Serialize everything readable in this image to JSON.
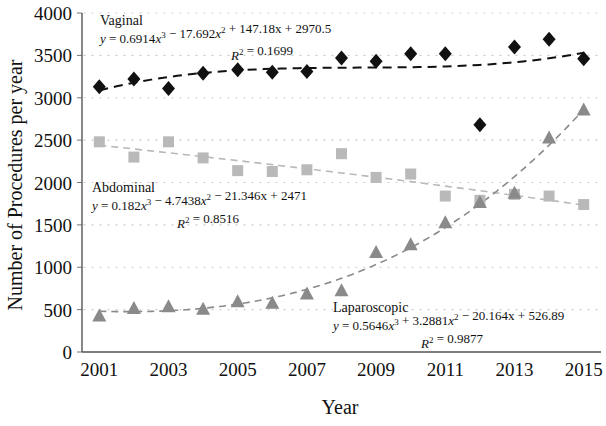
{
  "chart_data": {
    "type": "scatter",
    "title": "",
    "xlabel": "Year",
    "ylabel": "Number of Procedures per year",
    "xlim": [
      2000.5,
      2015.5
    ],
    "ylim": [
      0,
      4000
    ],
    "ytick_labels": [
      "4000",
      "3500",
      "3000",
      "2500",
      "2000",
      "1500",
      "1000",
      "500",
      "0"
    ],
    "ytick_values": [
      4000,
      3500,
      3000,
      2500,
      2000,
      1500,
      1000,
      500,
      0
    ],
    "xtick_labels": [
      "2001",
      "2003",
      "2005",
      "2007",
      "2009",
      "2011",
      "2013",
      "2015"
    ],
    "xtick_values": [
      2001,
      2003,
      2005,
      2007,
      2009,
      2011,
      2013,
      2015
    ],
    "x": [
      2001,
      2002,
      2003,
      2004,
      2005,
      2006,
      2007,
      2008,
      2009,
      2010,
      2011,
      2012,
      2013,
      2014,
      2015
    ],
    "grid": "dotted-horizontal",
    "legend_position": "inline-annotations",
    "series": [
      {
        "name": "Vaginal",
        "marker": "diamond",
        "color": "#111111",
        "trendline": "dashed",
        "equation": "y = 0.6914x3 − 17.692x2 + 147.18x + 2970.5",
        "r_squared": "R2 = 0.1699",
        "values": [
          3130,
          3220,
          3110,
          3290,
          3330,
          3300,
          3310,
          3470,
          3430,
          3520,
          3520,
          2680,
          3600,
          3690,
          3460
        ]
      },
      {
        "name": "Abdominal",
        "marker": "square",
        "color": "#b9b9b9",
        "trendline": "dashed",
        "equation": "y = 0.182x3 − 4.7438x2 − 21.346x + 2471",
        "r_squared": "R2 = 0.8516",
        "values": [
          2480,
          2300,
          2480,
          2290,
          2140,
          2130,
          2150,
          2340,
          2060,
          2100,
          1840,
          1790,
          1860,
          1840,
          1740
        ]
      },
      {
        "name": "Laparoscopic",
        "marker": "triangle",
        "color": "#8a8a8a",
        "trendline": "dashed",
        "equation": "y = 0.5646x3 + 3.2881x2 − 20.164x + 526.89",
        "r_squared": "R2 = 0.9877",
        "values": [
          430,
          520,
          540,
          510,
          600,
          580,
          690,
          730,
          1180,
          1270,
          1530,
          1770,
          1880,
          2530,
          2860
        ]
      }
    ],
    "annotations": [
      {
        "label": "Vaginal",
        "equation": "y = 0.6914x3 − 17.692x2 + 147.18x + 2970.5",
        "r2": "R2 = 0.1699"
      },
      {
        "label": "Abdominal",
        "equation": "y = 0.182x3 − 4.7438x2 − 21.346x + 2471",
        "r2": "R2 = 0.8516"
      },
      {
        "label": "Laparoscopic",
        "equation": "y = 0.5646x3 + 3.2881x2 − 20.164x + 526.89",
        "r2": "R2 = 0.9877"
      }
    ]
  }
}
